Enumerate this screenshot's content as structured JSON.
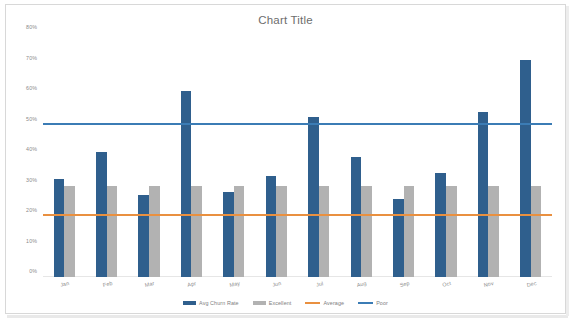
{
  "chart_data": {
    "type": "bar",
    "title": "Chart Title",
    "xlabel": "",
    "ylabel": "",
    "ylim": [
      0,
      80
    ],
    "y_tick_labels": [
      "0%",
      "10%",
      "20%",
      "30%",
      "40%",
      "50%",
      "60%",
      "70%",
      "80%"
    ],
    "y_tick_values": [
      0,
      10,
      20,
      30,
      40,
      50,
      60,
      70,
      80
    ],
    "grid": false,
    "legend_position": "bottom",
    "categories": [
      "Jan",
      "Feb",
      "Mar",
      "Apr",
      "May",
      "Jun",
      "Jul",
      "Aug",
      "Sep",
      "Oct",
      "Nov",
      "Dec"
    ],
    "series": [
      {
        "name": "Avg Churn Rate",
        "type": "bar",
        "color": "#2f5f8d",
        "values": [
          32,
          41,
          27,
          61,
          28,
          33,
          52.5,
          39.5,
          25.5,
          34,
          54,
          71
        ]
      },
      {
        "name": "Excellent",
        "type": "bar",
        "color": "#b2b2b2",
        "values": [
          30,
          30,
          30,
          30,
          30,
          30,
          30,
          30,
          30,
          30,
          30,
          30
        ]
      },
      {
        "name": "Average",
        "type": "line",
        "color": "#e99040",
        "values": [
          20,
          20,
          20,
          20,
          20,
          20,
          20,
          20,
          20,
          20,
          20,
          20
        ]
      },
      {
        "name": "Poor",
        "type": "line",
        "color": "#3b7cb5",
        "values": [
          50,
          50,
          50,
          50,
          50,
          50,
          50,
          50,
          50,
          50,
          50,
          50
        ]
      }
    ]
  }
}
